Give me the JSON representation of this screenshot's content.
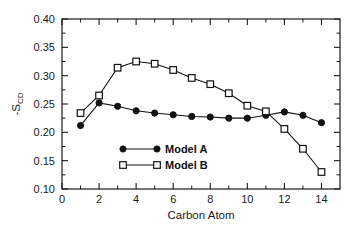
{
  "chart_data": {
    "type": "line",
    "title": "",
    "subtitle": "",
    "xlabel": "Carbon Atom",
    "ylabel": "-S",
    "ylabel_subscript": "CD",
    "ylabel_full": "-S_CD",
    "x": [
      1,
      2,
      3,
      4,
      5,
      6,
      7,
      8,
      9,
      10,
      11,
      12,
      13,
      14
    ],
    "series": [
      {
        "name": "Model A",
        "marker": "filled-circle",
        "values": [
          0.212,
          0.252,
          0.246,
          0.238,
          0.234,
          0.231,
          0.228,
          0.227,
          0.225,
          0.225,
          0.23,
          0.236,
          0.23,
          0.217
        ]
      },
      {
        "name": "Model B",
        "marker": "open-square",
        "values": [
          0.234,
          0.265,
          0.314,
          0.325,
          0.321,
          0.31,
          0.296,
          0.285,
          0.269,
          0.247,
          0.237,
          0.206,
          0.171,
          0.13
        ]
      }
    ],
    "xlim": [
      0,
      15
    ],
    "ylim": [
      0.1,
      0.4
    ],
    "xticks": [
      0,
      2,
      4,
      6,
      8,
      10,
      12,
      14
    ],
    "xtick_labels": [
      "0",
      "2",
      "4",
      "6",
      "8",
      "10",
      "12",
      "14"
    ],
    "xticks_minor": [
      1,
      3,
      5,
      7,
      9,
      11,
      13,
      15
    ],
    "yticks": [
      0.1,
      0.15,
      0.2,
      0.25,
      0.3,
      0.35,
      0.4
    ],
    "ytick_labels": [
      "0.10",
      "0.15",
      "0.20",
      "0.25",
      "0.30",
      "0.35",
      "0.40"
    ],
    "yticks_minor": [
      0.125,
      0.175,
      0.225,
      0.275,
      0.325,
      0.375
    ],
    "grid": false,
    "legend_position": "center-left-inside",
    "line_color": "#111111",
    "axis_color": "#1a1a1a",
    "background": "#ffffff"
  },
  "legend": {
    "entries": [
      {
        "label": "Model A",
        "marker": "filled-circle"
      },
      {
        "label": "Model B",
        "marker": "open-square"
      }
    ]
  }
}
